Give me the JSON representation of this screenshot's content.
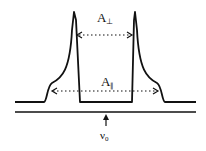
{
  "diagram": {
    "type": "EPR powder spectrum lineshape (axial anisotropy)",
    "labels": {
      "a_perp": "A",
      "a_perp_sub": "⊥",
      "a_par": "A",
      "a_par_sub": "∥",
      "nu": "ν",
      "nu_sub": "0"
    },
    "elements": [
      "absorption-lineshape-curve",
      "a-perp-double-arrow",
      "a-par-double-arrow",
      "frequency-axis-line",
      "nu0-marker-arrow"
    ],
    "colors": {
      "ink": "#111111",
      "background": "#ffffff"
    }
  }
}
